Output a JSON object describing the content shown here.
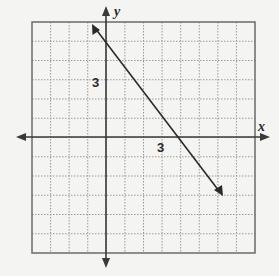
{
  "chart_data": {
    "type": "line",
    "title": "",
    "xlabel": "x",
    "ylabel": "y",
    "xlim": [
      -4,
      8
    ],
    "ylim": [
      -6,
      6
    ],
    "grid": true,
    "tick_labels": {
      "x": [
        "3"
      ],
      "y": [
        "3"
      ]
    },
    "series": [
      {
        "name": "line",
        "equation": "y = -5/4 x + 5",
        "x": [
          -0.7,
          0,
          4,
          6.2
        ],
        "y": [
          5.9,
          5,
          0,
          -2.75
        ],
        "arrows": "both"
      }
    ]
  },
  "labels": {
    "x_axis": "x",
    "y_axis": "y",
    "x_tick": "3",
    "y_tick": "3"
  },
  "colors": {
    "grid": "#9a9a9a",
    "axis": "#3a3a3a",
    "line": "#2a2a2a",
    "frame": "#6a6a6a"
  }
}
